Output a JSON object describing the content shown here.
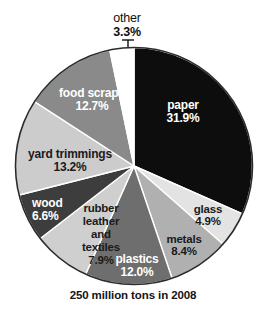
{
  "caption": "250 million tons in 2008",
  "chart_data": {
    "type": "pie",
    "title": "",
    "subtitle": "",
    "caption": "250 million tons in 2008",
    "total_label": "250 million tons in 2008",
    "units": "percent of total",
    "start_angle_deg": 0,
    "direction": "clockwise",
    "legend": "none (labels placed on slices)",
    "grid": false,
    "labels": [
      "paper",
      "glass",
      "metals",
      "plastics",
      "rubber leather and textiles",
      "wood",
      "yard trimmings",
      "food scraps",
      "other"
    ],
    "values": [
      31.9,
      4.9,
      8.4,
      12.0,
      7.9,
      6.6,
      13.2,
      12.7,
      3.3
    ],
    "slices": [
      {
        "name": "paper",
        "name_lines": [
          "paper"
        ],
        "value": 31.9,
        "value_label": "31.9%",
        "color": "#0d0d0d",
        "text_color": "#ffffff"
      },
      {
        "name": "glass",
        "name_lines": [
          "glass"
        ],
        "value": 4.9,
        "value_label": "4.9%",
        "color": "#e3e3e3",
        "text_color": "#1a1a1a"
      },
      {
        "name": "metals",
        "name_lines": [
          "metals"
        ],
        "value": 8.4,
        "value_label": "8.4%",
        "color": "#b0b0b0",
        "text_color": "#1a1a1a"
      },
      {
        "name": "plastics",
        "name_lines": [
          "plastics"
        ],
        "value": 12.0,
        "value_label": "12.0%",
        "color": "#6e6e6e",
        "text_color": "#ffffff"
      },
      {
        "name": "rubber leather and textiles",
        "name_lines": [
          "rubber",
          "leather",
          "and",
          "textiles"
        ],
        "value": 7.9,
        "value_label": "7.9%",
        "color": "#cfcfcf",
        "text_color": "#1a1a1a"
      },
      {
        "name": "wood",
        "name_lines": [
          "wood"
        ],
        "value": 6.6,
        "value_label": "6.6%",
        "color": "#3d3d3d",
        "text_color": "#ffffff"
      },
      {
        "name": "yard trimmings",
        "name_lines": [
          "yard trimmings"
        ],
        "value": 13.2,
        "value_label": "13.2%",
        "color": "#cccccc",
        "text_color": "#1a1a1a"
      },
      {
        "name": "food scraps",
        "name_lines": [
          "food scraps"
        ],
        "value": 12.7,
        "value_label": "12.7%",
        "color": "#8a8a8a",
        "text_color": "#ffffff"
      },
      {
        "name": "other",
        "name_lines": [
          "other"
        ],
        "value": 3.3,
        "value_label": "3.3%",
        "color": "#ffffff",
        "text_color": "#111111",
        "label_outside": true,
        "leader_line": true
      }
    ]
  },
  "labels": {
    "paper": {
      "name": "paper",
      "pct": "31.9%"
    },
    "glass": {
      "name": "glass",
      "pct": "4.9%"
    },
    "metals": {
      "name": "metals",
      "pct": "8.4%"
    },
    "plastics": {
      "name": "plastics",
      "pct": "12.0%"
    },
    "rubber": {
      "line1": "rubber",
      "line2": "leather",
      "line3": "and",
      "line4": "textiles",
      "pct": "7.9%"
    },
    "wood": {
      "name": "wood",
      "pct": "6.6%"
    },
    "yard": {
      "name": "yard trimmings",
      "pct": "13.2%"
    },
    "food": {
      "name": "food scraps",
      "pct": "12.7%"
    },
    "other": {
      "name": "other",
      "pct": "3.3%"
    }
  },
  "style": {
    "pie_outline": "#2b2b2b",
    "slice_divider": "#ffffff",
    "background": "#ffffff"
  }
}
